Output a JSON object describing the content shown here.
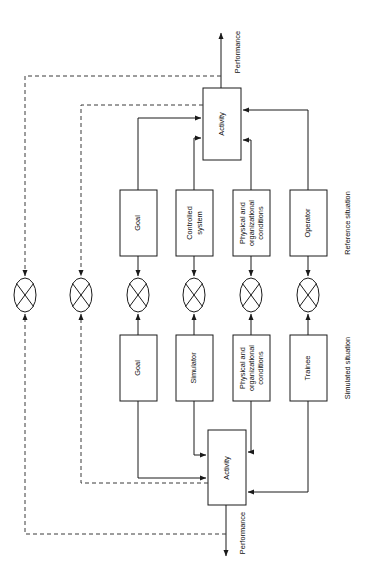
{
  "diagram": {
    "colors": {
      "background": "#ffffff",
      "stroke": "#1a1a1a",
      "dashed_stroke": "#3a3a3a",
      "text": "#111111"
    },
    "section_labels": {
      "reference": "Reference situation",
      "simulated": "Simulated situation"
    },
    "reference_row": {
      "activity": "Activity",
      "performance": "Performance",
      "boxes": [
        {
          "id": "ref-goal",
          "label": "Goal"
        },
        {
          "id": "ref-controlled-system",
          "label": "Controlled\nsystem"
        },
        {
          "id": "ref-conditions",
          "label": "Physical and\norganizational\nconditions"
        },
        {
          "id": "ref-operator",
          "label": "Operator"
        }
      ]
    },
    "simulated_row": {
      "activity": "Activity",
      "performance": "Performance",
      "boxes": [
        {
          "id": "sim-goal",
          "label": "Goal"
        },
        {
          "id": "sim-simulator",
          "label": "Simulator"
        },
        {
          "id": "sim-conditions",
          "label": "Physical and\norganizational\nconditions"
        },
        {
          "id": "sim-trainee",
          "label": "Trainee"
        }
      ]
    },
    "comparators": [
      {
        "id": "comparator-performance-outer",
        "symbol": "crossed-ellipse"
      },
      {
        "id": "comparator-performance-inner",
        "symbol": "crossed-ellipse"
      },
      {
        "id": "comparator-goal",
        "symbol": "crossed-ellipse"
      },
      {
        "id": "comparator-system",
        "symbol": "crossed-ellipse"
      },
      {
        "id": "comparator-conditions",
        "symbol": "crossed-ellipse"
      },
      {
        "id": "comparator-person",
        "symbol": "crossed-ellipse"
      }
    ]
  }
}
